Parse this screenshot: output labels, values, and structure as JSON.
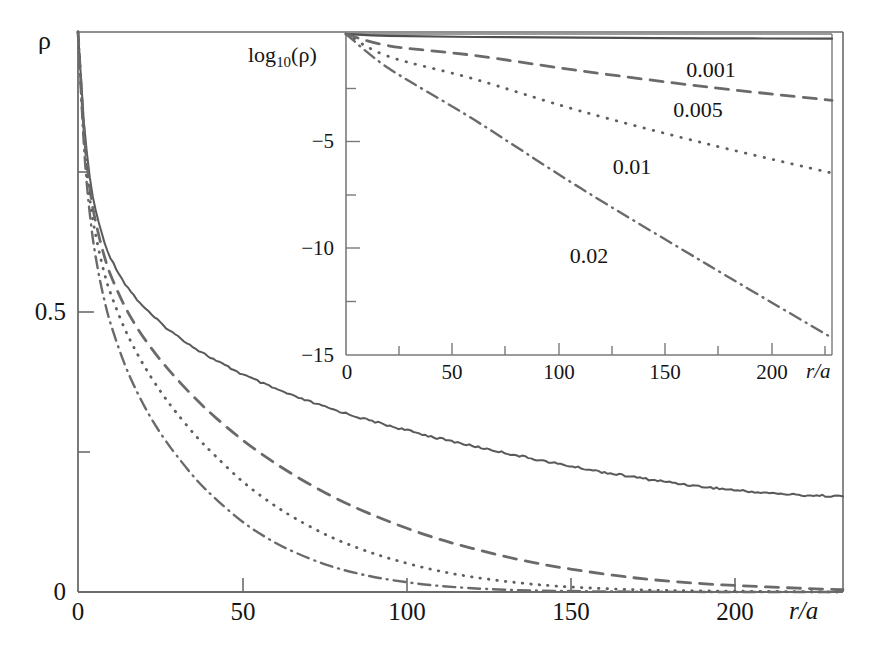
{
  "figure": {
    "background": "#ffffff",
    "ink_color": "#4a4a4a",
    "text_color": "#151515"
  },
  "main_plot": {
    "ylabel": "ρ",
    "xlabel": "r/a",
    "y_ticks": [
      "0",
      "0.5"
    ],
    "x_ticks": [
      "0",
      "50",
      "100",
      "150",
      "200"
    ]
  },
  "inset_plot": {
    "ylabel_main": "log",
    "ylabel_sub": "10",
    "ylabel_tail": "(ρ)",
    "xlabel": "r/a",
    "y_ticks": [
      "−5",
      "−10",
      "−15"
    ],
    "x_ticks": [
      "0",
      "50",
      "100",
      "150",
      "200"
    ]
  },
  "curve_labels": {
    "c1": "0.001",
    "c2": "0.005",
    "c3": "0.01",
    "c4": "0.02"
  },
  "chart_data": {
    "type": "line",
    "title": "",
    "panels": [
      {
        "name": "main",
        "xlabel": "r/a",
        "ylabel": "ρ",
        "xlim": [
          0,
          233
        ],
        "ylim": [
          0,
          1.0
        ],
        "xticks": [
          0,
          50,
          100,
          150,
          200
        ],
        "xticklabels": [
          "0",
          "50",
          "100",
          "150",
          "200"
        ],
        "yticks": [
          0,
          0.5,
          1.0
        ],
        "yticklabels": [
          "0",
          "0.5",
          "ρ"
        ],
        "minor_yticks": [
          0.25,
          0.75
        ],
        "grid": false,
        "legend": "inline-annotations",
        "series": [
          {
            "name": "0.001",
            "style": "solid",
            "noisy": true,
            "x": [
              0,
              2,
              4,
              6,
              8,
              10,
              14,
              18,
              22,
              26,
              30,
              36,
              42,
              50,
              58,
              66,
              76,
              86,
              96,
              108,
              120,
              132,
              146,
              160,
              175,
              190,
              205,
              220,
              233
            ],
            "y": [
              1.0,
              0.82,
              0.72,
              0.665,
              0.625,
              0.595,
              0.553,
              0.522,
              0.497,
              0.476,
              0.458,
              0.434,
              0.413,
              0.389,
              0.368,
              0.349,
              0.329,
              0.311,
              0.295,
              0.277,
              0.261,
              0.246,
              0.229,
              0.214,
              0.2,
              0.188,
              0.179,
              0.173,
              0.171
            ]
          },
          {
            "name": "0.005",
            "style": "dashed",
            "noisy": false,
            "x": [
              0,
              2,
              4,
              6,
              8,
              10,
              14,
              18,
              22,
              26,
              30,
              36,
              42,
              50,
              58,
              66,
              76,
              86,
              96,
              108,
              120,
              135,
              150,
              170,
              190,
              210,
              233
            ],
            "y": [
              1.0,
              0.81,
              0.705,
              0.645,
              0.6,
              0.565,
              0.513,
              0.472,
              0.438,
              0.408,
              0.381,
              0.344,
              0.311,
              0.272,
              0.238,
              0.208,
              0.175,
              0.147,
              0.123,
              0.098,
              0.078,
              0.057,
              0.041,
              0.025,
              0.015,
              0.009,
              0.004
            ]
          },
          {
            "name": "0.01",
            "style": "dotted",
            "noisy": false,
            "x": [
              0,
              2,
              4,
              6,
              8,
              10,
              14,
              18,
              22,
              26,
              30,
              36,
              42,
              50,
              58,
              66,
              76,
              86,
              96,
              108,
              120,
              135,
              150,
              170,
              190,
              233
            ],
            "y": [
              1.0,
              0.795,
              0.685,
              0.62,
              0.57,
              0.532,
              0.473,
              0.426,
              0.386,
              0.351,
              0.32,
              0.278,
              0.242,
              0.198,
              0.162,
              0.132,
              0.101,
              0.077,
              0.058,
              0.04,
              0.027,
              0.016,
              0.009,
              0.004,
              0.002,
              0.0
            ]
          },
          {
            "name": "0.02",
            "style": "dashdot",
            "noisy": false,
            "x": [
              0,
              2,
              4,
              6,
              8,
              10,
              14,
              18,
              22,
              26,
              30,
              36,
              42,
              50,
              58,
              66,
              76,
              86,
              96,
              110,
              130,
              160,
              200,
              233
            ],
            "y": [
              1.0,
              0.78,
              0.655,
              0.578,
              0.522,
              0.478,
              0.41,
              0.357,
              0.313,
              0.276,
              0.244,
              0.201,
              0.166,
              0.126,
              0.095,
              0.071,
              0.048,
              0.032,
              0.021,
              0.011,
              0.004,
              0.001,
              0.0,
              0.0
            ]
          }
        ]
      },
      {
        "name": "inset",
        "xlabel": "r/a",
        "ylabel": "log10(ρ)",
        "xlim": [
          0,
          228
        ],
        "ylim": [
          -15,
          0
        ],
        "xticks": [
          0,
          50,
          100,
          150,
          200
        ],
        "xticklabels": [
          "0",
          "50",
          "100",
          "150",
          "200"
        ],
        "yticks": [
          -15,
          -10,
          -5,
          0
        ],
        "yticklabels": [
          "−15",
          "−10",
          "−5",
          ""
        ],
        "minor_yticks": [
          -12.5,
          -7.5,
          -2.5
        ],
        "grid": false,
        "legend": "inline-annotations",
        "series": [
          {
            "name": "0.001",
            "style": "solid",
            "x": [
              0,
              20,
              60,
              110,
              170,
              228
            ],
            "y": [
              0.0,
              -0.09,
              -0.14,
              -0.17,
              -0.2,
              -0.22
            ]
          },
          {
            "name": "0.005",
            "style": "dashed",
            "x": [
              0,
              20,
              60,
              110,
              170,
              228
            ],
            "y": [
              0.0,
              -0.55,
              -1.0,
              -1.72,
              -2.48,
              -3.1
            ]
          },
          {
            "name": "0.01",
            "style": "dotted",
            "x": [
              0,
              20,
              60,
              110,
              170,
              228
            ],
            "y": [
              0.0,
              -1.05,
              -2.1,
              -3.6,
              -5.15,
              -6.5
            ]
          },
          {
            "name": "0.02",
            "style": "dashdot",
            "x": [
              0,
              20,
              60,
              110,
              170,
              228
            ],
            "y": [
              0.0,
              -1.6,
              -4.0,
              -7.2,
              -10.8,
              -14.2
            ]
          }
        ]
      }
    ],
    "annotations": [
      {
        "text": "0.001",
        "panel": "inset",
        "x": 160,
        "y": -1.0
      },
      {
        "text": "0.005",
        "panel": "inset",
        "x": 140,
        "y": -3.2
      },
      {
        "text": "0.01",
        "panel": "inset",
        "x": 112,
        "y": -5.6
      },
      {
        "text": "0.02",
        "panel": "inset",
        "x": 78,
        "y": -10.0
      }
    ]
  }
}
